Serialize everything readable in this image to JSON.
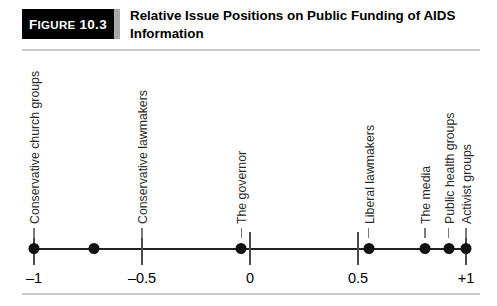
{
  "figure": {
    "tag_word": "Figure",
    "tag_number": "10.3",
    "title": "Relative Issue Positions on Public Funding of AIDS Information"
  },
  "chart_data": {
    "type": "scatter",
    "title": "Relative Issue Positions on Public Funding of AIDS Information",
    "xlabel": "",
    "ylabel": "",
    "xlim": [
      -1,
      1
    ],
    "grid": false,
    "legend": "none",
    "axis_ticks": [
      {
        "value": -1,
        "label": "–1"
      },
      {
        "value": -0.5,
        "label": "–0.5"
      },
      {
        "value": 0,
        "label": "0"
      },
      {
        "value": 0.5,
        "label": "0.5"
      },
      {
        "value": 1,
        "label": "+1"
      }
    ],
    "points": [
      {
        "label": "Conservative church groups",
        "value": -1.0
      },
      {
        "label": "",
        "value": -0.72
      },
      {
        "label": "Conservative lawmakers",
        "value": -0.5
      },
      {
        "label": "The governor",
        "value": -0.04
      },
      {
        "label": "Liberal lawmakers",
        "value": 0.55
      },
      {
        "label": "The media",
        "value": 0.81
      },
      {
        "label": "Public health groups",
        "value": 0.92
      },
      {
        "label": "Activist groups",
        "value": 1.0
      }
    ],
    "marker_values": [
      -1.0,
      -0.72,
      -0.04,
      0.55,
      0.81,
      0.92,
      1.0
    ],
    "category_labels": [
      {
        "text": "Conservative church groups",
        "value": -1.0
      },
      {
        "text": "Conservative lawmakers",
        "value": -0.5
      },
      {
        "text": "The governor",
        "value": -0.04
      },
      {
        "text": "Liberal lawmakers",
        "value": 0.55
      },
      {
        "text": "The media",
        "value": 0.81
      },
      {
        "text": "Public health groups",
        "value": 0.92
      },
      {
        "text": "Activist groups",
        "value": 1.0
      }
    ]
  },
  "colors": {
    "tag_background": "#000000",
    "tag_accent": "#a8a8a8",
    "axis": "#222222",
    "marker": "#111111",
    "rule": "#c9c9c9",
    "label_text": "#2a2a2a"
  }
}
